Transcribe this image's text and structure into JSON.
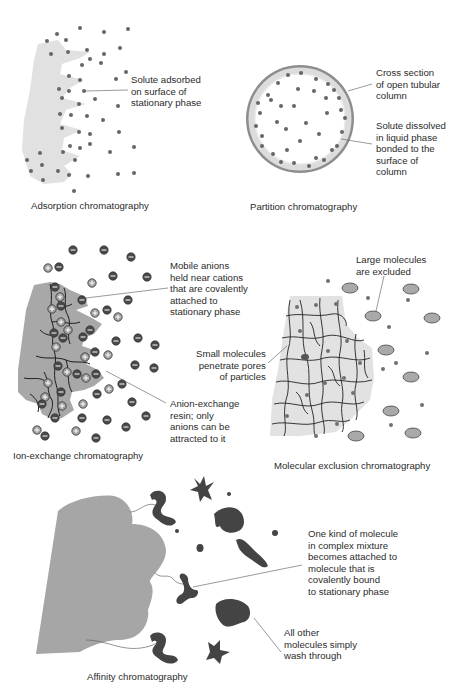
{
  "figure": {
    "panels": [
      {
        "id": "adsorption",
        "caption": "Adsorption chromatography",
        "annotations": [
          {
            "text": "Solute adsorbed\non surface of\nstationary phase"
          }
        ]
      },
      {
        "id": "partition",
        "caption": "Partition chromatography",
        "annotations": [
          {
            "text": "Cross section\nof open tubular\ncolumn"
          },
          {
            "text": "Solute dissolved\nin liquid phase\nbonded to the\nsurface of\ncolumn"
          }
        ]
      },
      {
        "id": "ion-exchange",
        "caption": "Ion-exchange chromatography",
        "annotations": [
          {
            "text": "Mobile anions\nheld near cations\nthat are covalently\nattached to\nstationary phase"
          },
          {
            "text": "Anion-exchange\nresin; only\nanions can be\nattracted to it"
          }
        ]
      },
      {
        "id": "molecular-exclusion",
        "caption": "Molecular exclusion chromatography",
        "annotations": [
          {
            "text": "Large molecules\nare excluded"
          },
          {
            "text": "Small molecules\npenetrate pores\nof particles"
          }
        ]
      },
      {
        "id": "affinity",
        "caption": "Affinity chromatography",
        "annotations": [
          {
            "text": "One kind of molecule\nin complex mixture\nbecomes attached to\nmolecule that is\ncovalently bound\nto stationary phase"
          },
          {
            "text": "All other\nmolecules simply\nwash through"
          }
        ]
      }
    ],
    "colors": {
      "stationary_phase": "#d9d9d9",
      "solute": "#6a6a6a",
      "column_wall": "#8a8a8a",
      "resin": "#a9a9a9",
      "anion": "#505050",
      "cation": "#9a9a9a",
      "affinity_molecule": "#444444"
    }
  }
}
